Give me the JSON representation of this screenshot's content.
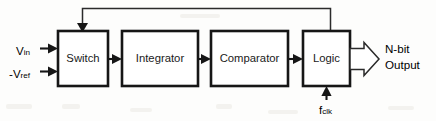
{
  "diagram": {
    "background_color": "#fdfdfc",
    "line_color": "#161616",
    "blocks": [
      {
        "id": "switch",
        "label": "Switch",
        "x": 58,
        "y": 31,
        "w": 50,
        "h": 55
      },
      {
        "id": "integrator",
        "label": "Integrator",
        "x": 122,
        "y": 31,
        "w": 76,
        "h": 55
      },
      {
        "id": "comparator",
        "label": "Comparator",
        "x": 211,
        "y": 31,
        "w": 77,
        "h": 55
      },
      {
        "id": "logic",
        "label": "Logic",
        "x": 303,
        "y": 31,
        "w": 47,
        "h": 55
      }
    ],
    "inputs": [
      {
        "id": "vin",
        "base": "V",
        "sub": "in",
        "prefix": "",
        "x": 16,
        "y": 49
      },
      {
        "id": "vref",
        "base": "V",
        "sub": "ref",
        "prefix": "-",
        "x": 10,
        "y": 72
      }
    ],
    "clock": {
      "id": "fclk",
      "base": "f",
      "sub": "clk",
      "prefix": ""
    },
    "output": {
      "id": "nbit-output",
      "line1": "N-bit",
      "line2": "Output"
    },
    "connections": [
      {
        "from": "switch",
        "to": "integrator",
        "type": "signal-arrow"
      },
      {
        "from": "integrator",
        "to": "comparator",
        "type": "signal-arrow"
      },
      {
        "from": "comparator",
        "to": "logic",
        "type": "signal-arrow"
      },
      {
        "from": "logic",
        "to": "switch",
        "type": "feedback-loop"
      },
      {
        "from": "clock",
        "to": "logic",
        "type": "signal-arrow"
      },
      {
        "from": "logic",
        "to": "output",
        "type": "bus-arrow"
      }
    ]
  }
}
